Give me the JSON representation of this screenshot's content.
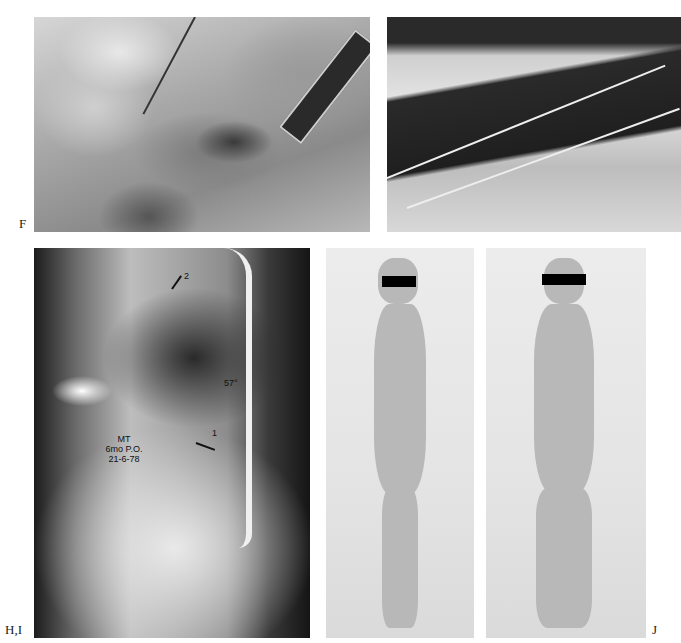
{
  "page": {
    "type": "figure-plate",
    "background": "#ffffff"
  },
  "panels": [
    {
      "id": "F",
      "label": "F",
      "description": "Intraoperative photograph of anterior spinal exposure with retractor"
    },
    {
      "id": "G",
      "label": "",
      "description": "Intraoperative photograph of posterior spinal fusion with wires along rods"
    },
    {
      "id": "HI",
      "label": "H,I",
      "description": "Lateral spinal radiograph with instrumentation",
      "annotations": {
        "line1": "MT",
        "line2": "6mo P.O.",
        "line3": "21-6-78",
        "upper_marker": "2",
        "middle_marker": "57°",
        "lower_marker": "1"
      }
    },
    {
      "id": "J",
      "label": "J",
      "description": "Clinical photographs of patient, lateral and anterior views"
    }
  ]
}
